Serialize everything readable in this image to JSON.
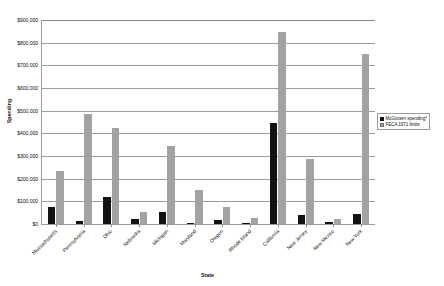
{
  "chart_data": {
    "type": "bar",
    "title": "",
    "xlabel": "State",
    "ylabel": "Spending",
    "ylim": [
      0,
      900000
    ],
    "ytick_labels": [
      "$900,000",
      "$800,000",
      "$700,000",
      "$600,000",
      "$500,000",
      "$400,000",
      "$300,000",
      "$200,000",
      "$100,000",
      "$0"
    ],
    "ytick_values": [
      900000,
      800000,
      700000,
      600000,
      500000,
      400000,
      300000,
      200000,
      100000,
      0
    ],
    "grid": true,
    "legend_position": "right",
    "categories": [
      "Massachusetts",
      "Pennsylvania",
      "Ohio",
      "Nebraska",
      "Michigan",
      "Maryland",
      "Oregon",
      "Rhode Island",
      "California",
      "New Jersey",
      "New Mexico",
      "New York"
    ],
    "series": [
      {
        "name": "McGovern spending*",
        "color": "#121212",
        "values": [
          76000,
          13000,
          118000,
          23000,
          51000,
          4000,
          17000,
          6000,
          445000,
          40000,
          7000,
          44000
        ]
      },
      {
        "name": "FECA 1971 limits",
        "color": "#a3a3a3",
        "values": [
          233000,
          487000,
          425000,
          53000,
          345000,
          152000,
          77000,
          27000,
          845000,
          287000,
          21000,
          748000
        ]
      }
    ]
  }
}
